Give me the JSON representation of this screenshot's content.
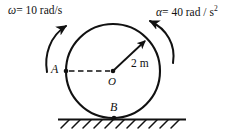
{
  "figure": {
    "type": "physics-diagram",
    "labels": {
      "omega_symbol": "ω",
      "omega_equation": "= 10 rad/s",
      "omega_full": "ω = 10 rad/s",
      "omega_value": "10",
      "omega_units": "rad/s",
      "alpha_symbol": "α",
      "alpha_equation": "= 40 rad / s",
      "alpha_exponent": "2",
      "alpha_full": "α = 40 rad / s²",
      "alpha_value": "40",
      "alpha_units": "rad/s^2",
      "radius_label": "2 m",
      "radius_value": "2",
      "radius_units": "m",
      "point_a": "A",
      "point_o": "O",
      "point_b": "B"
    },
    "geometry": {
      "center_x": 113,
      "center_y": 71,
      "radius_px": 47,
      "point_a_x": 66,
      "point_a_y": 71,
      "point_b_x": 114,
      "point_b_y": 118,
      "ground_y": 119,
      "ground_x_start": 58,
      "ground_x_end": 186,
      "hatch_count": 11
    },
    "colors": {
      "stroke": "#111111",
      "background": "#ffffff",
      "text": "#111111"
    }
  }
}
